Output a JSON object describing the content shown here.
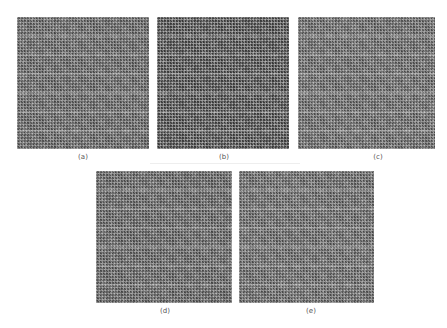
{
  "figure": {
    "panels": [
      {
        "id": "a",
        "label": "(a)",
        "x": 17,
        "y": 17,
        "w": 132,
        "h": 132,
        "tone": "#6e6e6e"
      },
      {
        "id": "b",
        "label": "(b)",
        "x": 157,
        "y": 17,
        "w": 132,
        "h": 132,
        "tone": "#555555"
      },
      {
        "id": "c",
        "label": "(c)",
        "x": 298,
        "y": 17,
        "w": 137,
        "h": 132,
        "tone": "#727272"
      },
      {
        "id": "d",
        "label": "(d)",
        "x": 96,
        "y": 171,
        "w": 136,
        "h": 132,
        "tone": "#6c6c6c"
      },
      {
        "id": "e",
        "label": "(e)",
        "x": 239,
        "y": 171,
        "w": 135,
        "h": 132,
        "tone": "#727272"
      }
    ]
  }
}
